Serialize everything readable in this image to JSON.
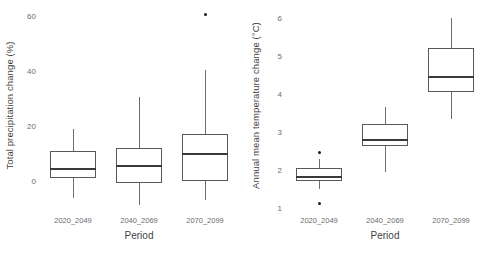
{
  "figure": {
    "width": 492,
    "height": 264,
    "background": "#ffffff",
    "panel_count": 2,
    "line_color": "#595959",
    "median_color": "#3a3a3a",
    "outlier_color": "#1a1a1a",
    "text_color": "#6b6b6b"
  },
  "chart_data": [
    {
      "type": "box",
      "panel": "left",
      "title": "",
      "xlabel": "Period",
      "ylabel": "Total precipitation change (%)",
      "categories": [
        "2020_2049",
        "2040_2069",
        "2070_2099"
      ],
      "ylim": [
        -12,
        63
      ],
      "yticks": [
        0,
        20,
        40,
        60
      ],
      "ytick_labels": [
        "0",
        "20",
        "40",
        "60"
      ],
      "grid": false,
      "legend": "none",
      "boxes": [
        {
          "category": "2020_2049",
          "whisker_low": -6,
          "q1": 1,
          "median": 4.4,
          "q3": 11,
          "whisker_high": 19,
          "outliers": []
        },
        {
          "category": "2040_2069",
          "whisker_low": -8.7,
          "q1": -0.7,
          "median": 5.5,
          "q3": 12,
          "whisker_high": 30.5,
          "outliers": []
        },
        {
          "category": "2070_2099",
          "whisker_low": -7,
          "q1": 0,
          "median": 9.8,
          "q3": 17.2,
          "whisker_high": 40.5,
          "outliers": [
            60.5
          ]
        }
      ]
    },
    {
      "type": "box",
      "panel": "right",
      "title": "",
      "xlabel": "Period",
      "ylabel": "Annual mean temperature change (°C)",
      "categories": [
        "2020_2049",
        "2040_2069",
        "2070_2099"
      ],
      "ylim": [
        0.85,
        6.25
      ],
      "yticks": [
        1,
        2,
        3,
        4,
        5,
        6
      ],
      "ytick_labels": [
        "1",
        "2",
        "3",
        "4",
        "5",
        "6"
      ],
      "grid": false,
      "legend": "none",
      "boxes": [
        {
          "category": "2020_2049",
          "whisker_low": 1.5,
          "q1": 1.72,
          "median": 1.82,
          "q3": 2.05,
          "whisker_high": 2.3,
          "outliers": [
            2.45,
            1.12
          ]
        },
        {
          "category": "2040_2069",
          "whisker_low": 1.95,
          "q1": 2.62,
          "median": 2.8,
          "q3": 3.2,
          "whisker_high": 3.65,
          "outliers": []
        },
        {
          "category": "2070_2099",
          "whisker_low": 3.35,
          "q1": 4.05,
          "median": 4.45,
          "q3": 5.2,
          "whisker_high": 6.0,
          "outliers": []
        }
      ]
    }
  ]
}
